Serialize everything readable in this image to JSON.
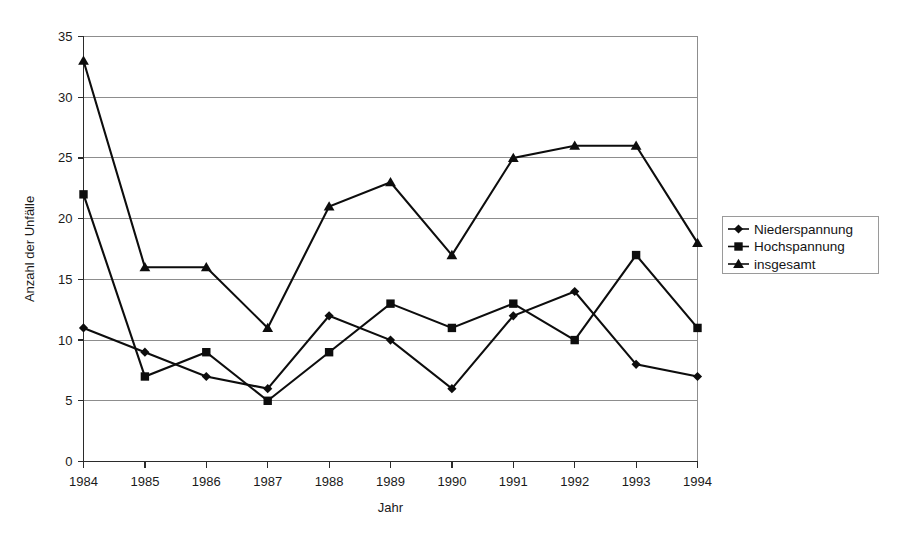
{
  "chart_data": {
    "type": "line",
    "title": "",
    "xlabel": "Jahr",
    "ylabel": "Anzahl der Unfälle",
    "categories": [
      "1984",
      "1985",
      "1986",
      "1987",
      "1988",
      "1989",
      "1990",
      "1991",
      "1992",
      "1993",
      "1994"
    ],
    "x": [
      1984,
      1985,
      1986,
      1987,
      1988,
      1989,
      1990,
      1991,
      1992,
      1993,
      1994
    ],
    "ylim": [
      0,
      35
    ],
    "xlim": [
      1984,
      1994
    ],
    "yticks": [
      0,
      5,
      10,
      15,
      20,
      25,
      30,
      35
    ],
    "ytick_labels": [
      "0",
      "5",
      "10",
      "15",
      "20",
      "25",
      "30",
      "35"
    ],
    "xtick_labels": [
      "1984",
      "1985",
      "1986",
      "1987",
      "1988",
      "1989",
      "1990",
      "1991",
      "1992",
      "1993",
      "1994"
    ],
    "grid": "horizontal",
    "legend_position": "right",
    "series": [
      {
        "name": "Niederspannung",
        "marker": "diamond",
        "color": "#0d0d0d",
        "values": [
          11,
          9,
          7,
          6,
          12,
          10,
          6,
          12,
          14,
          8,
          7
        ]
      },
      {
        "name": "Hochspannung",
        "marker": "square",
        "color": "#0d0d0d",
        "values": [
          22,
          7,
          9,
          5,
          9,
          13,
          11,
          13,
          10,
          17,
          11
        ]
      },
      {
        "name": "insgesamt",
        "marker": "triangle",
        "color": "#0d0d0d",
        "values": [
          33,
          16,
          16,
          11,
          21,
          23,
          17,
          25,
          26,
          26,
          18
        ]
      }
    ]
  },
  "axes": {
    "y_title": "Anzahl der Unfälle",
    "x_title": "Jahr"
  },
  "legend": {
    "entries": [
      {
        "label": "Niederspannung",
        "marker": "diamond-marker-icon"
      },
      {
        "label": "Hochspannung",
        "marker": "square-marker-icon"
      },
      {
        "label": "insgesamt",
        "marker": "triangle-marker-icon"
      }
    ]
  },
  "colors": {
    "background": "#ffffff",
    "ink": "#0d0d0d",
    "grid": "#8d8d8d",
    "axis": "#2b2b2b",
    "legend_border": "#9a9a9a"
  }
}
